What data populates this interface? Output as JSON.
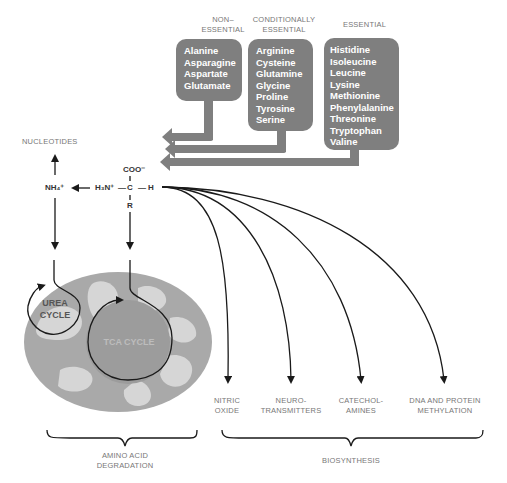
{
  "categories": [
    {
      "header": [
        "NON–",
        "ESSENTIAL"
      ],
      "amino_acids": [
        "Alanine",
        "Asparagine",
        "Aspartate",
        "Glutamate"
      ]
    },
    {
      "header": [
        "CONDITIONALLY",
        "ESSENTIAL"
      ],
      "amino_acids": [
        "Arginine",
        "Cysteine",
        "Glutamine",
        "Glycine",
        "Proline",
        "Tyrosine",
        "Serine"
      ]
    },
    {
      "header": [
        "ESSENTIAL"
      ],
      "amino_acids": [
        "Histidine",
        "Isoleucine",
        "Leucine",
        "Lysine",
        "Methionine",
        "Phenylalanine",
        "Threonine",
        "Tryptophan",
        "Valine"
      ]
    }
  ],
  "molecule": {
    "top": "COO⁻",
    "amine": "H₃N⁺",
    "center": "C",
    "hydrogen": "H",
    "side_chain": "R",
    "ammonium": "NH₄⁺",
    "bond_h": "—",
    "bond_v": "|"
  },
  "nucleotides": "NUCLEOTIDES",
  "cycles": {
    "urea": [
      "UREA",
      "CYCLE"
    ],
    "tca": "TCA CYCLE"
  },
  "products": [
    [
      "NITRIC",
      "OXIDE"
    ],
    [
      "NEURO-",
      "TRANSMITTERS"
    ],
    [
      "CATECHOL-",
      "AMINES"
    ],
    [
      "DNA AND PROTEIN",
      "METHYLATION"
    ]
  ],
  "groups": {
    "degradation": [
      "AMINO ACID",
      "DEGRADATION"
    ],
    "biosynthesis": "BIOSYNTHESIS"
  },
  "colors": {
    "box": "#7f7f7f",
    "label": "#777777",
    "line": "#1a1a1a",
    "mito_outer": "#a9a9a9",
    "mito_inner": "#d6d6d6",
    "tca": "#9c9c9c"
  }
}
